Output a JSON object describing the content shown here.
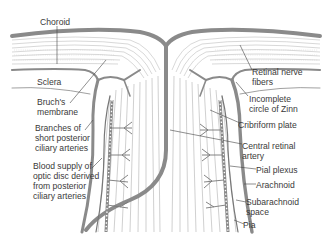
{
  "diagram": {
    "labels": {
      "choroid": "Choroid",
      "sclera": "Sclera",
      "bruchs_membrane": "Bruch's\nmembrane",
      "branches_short_posterior": "Branches of\nshort posterior\nciliary arteries",
      "blood_supply_optic_disc": "Blood supply of\noptic disc derived\nfrom posterior\nciliary arteries",
      "retinal_nerve_fibers": "Retinal nerve\nfibers",
      "incomplete_circle_zinn": "Incomplete\ncircle of Zinn",
      "cribriform_plate": "Cribriform plate",
      "central_retinal_artery": "Central retinal\nartery",
      "pial_plexus": "Pial plexus",
      "arachnoid": "Arachnoid",
      "subarachnoid_space": "Subarachnoid\nspace",
      "pia": "Pia"
    },
    "colors": {
      "vessel": "#8a8a8a",
      "vessel_dark": "#6e6e6e",
      "fiber": "#b5b5b5",
      "leader": "#444444",
      "text": "#3a3a3a"
    }
  }
}
